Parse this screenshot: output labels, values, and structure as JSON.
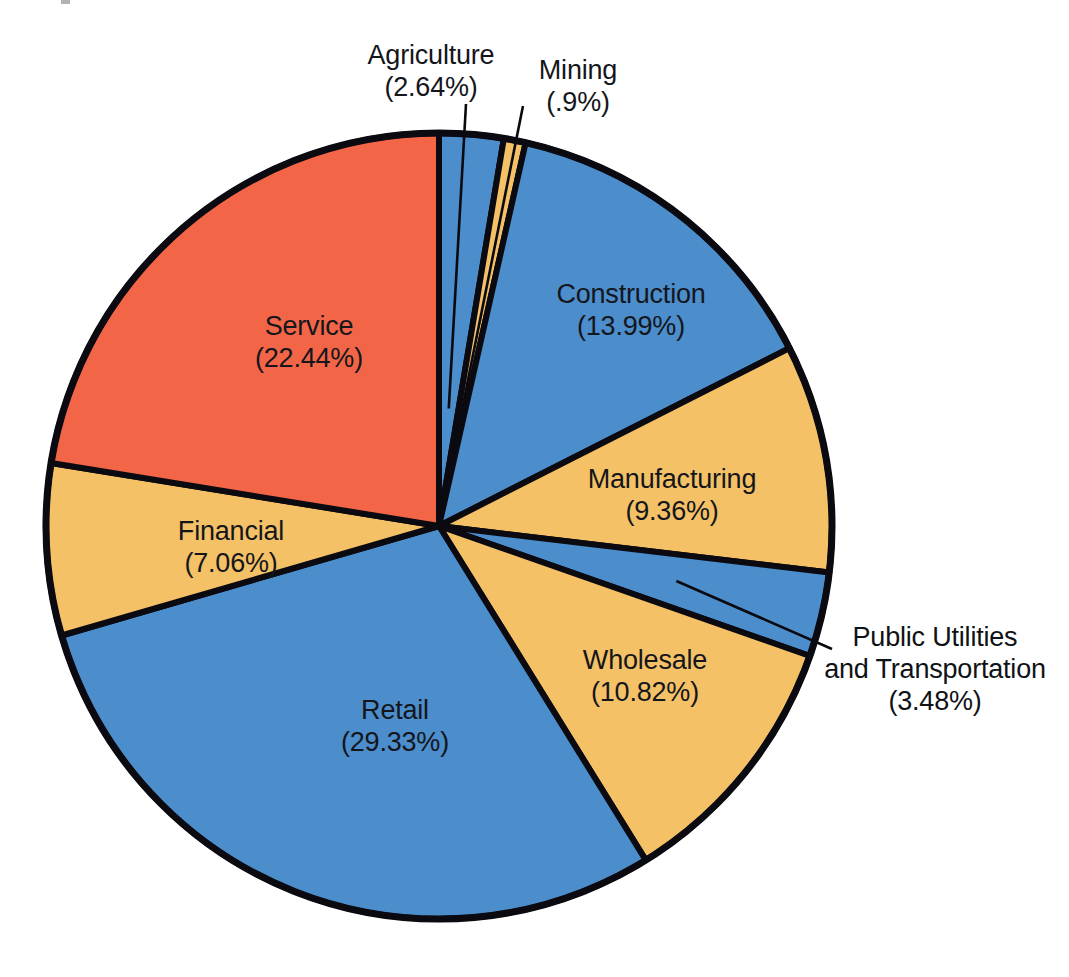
{
  "chart_data": {
    "type": "pie",
    "title": "",
    "subtitle": "",
    "xlabel": "",
    "ylabel": "",
    "legend_position": "none",
    "grid": false,
    "units": "percent",
    "total": 100,
    "start_angle_deg": 0,
    "direction": "clockwise",
    "categories": [
      "Agriculture",
      "Mining",
      "Construction",
      "Manufacturing",
      "Public Utilities and Transportation",
      "Wholesale",
      "Retail",
      "Financial",
      "Service"
    ],
    "values": [
      2.64,
      0.9,
      13.99,
      9.36,
      3.48,
      10.82,
      29.33,
      7.06,
      22.44
    ],
    "slices": [
      {
        "name": "Agriculture",
        "value": 2.64,
        "percent_text": "(2.64%)",
        "color": "#4C8DCB",
        "label_placement": "outside",
        "leader_line": true
      },
      {
        "name": "Mining",
        "value": 0.9,
        "percent_text": "(.9%)",
        "color": "#F5C167",
        "label_placement": "outside",
        "leader_line": true
      },
      {
        "name": "Construction",
        "value": 13.99,
        "percent_text": "(13.99%)",
        "color": "#4C8DCB",
        "label_placement": "inside",
        "leader_line": false
      },
      {
        "name": "Manufacturing",
        "value": 9.36,
        "percent_text": "(9.36%)",
        "color": "#F5C167",
        "label_placement": "inside",
        "leader_line": false
      },
      {
        "name": "Public Utilities and Transportation",
        "value": 3.48,
        "percent_text": "(3.48%)",
        "color": "#4C8DCB",
        "label_placement": "outside",
        "leader_line": true
      },
      {
        "name": "Wholesale",
        "value": 10.82,
        "percent_text": "(10.82%)",
        "color": "#F5C167",
        "label_placement": "inside",
        "leader_line": false
      },
      {
        "name": "Retail",
        "value": 29.33,
        "percent_text": "(29.33%)",
        "color": "#4C8DCB",
        "label_placement": "inside",
        "leader_line": false
      },
      {
        "name": "Financial",
        "value": 7.06,
        "percent_text": "(7.06%)",
        "color": "#F5C167",
        "label_placement": "inside",
        "leader_line": false
      },
      {
        "name": "Service",
        "value": 22.44,
        "percent_text": "(22.44%)",
        "color": "#F26547",
        "label_placement": "inside",
        "leader_line": false
      }
    ],
    "colors": {
      "blue": "#4C8DCB",
      "gold": "#F5C167",
      "red": "#F26547",
      "outline": "#0A0A10",
      "background": "#FFFFFF"
    }
  },
  "labels": {
    "agriculture": {
      "name": "Agriculture",
      "pct": "(2.64%)"
    },
    "mining": {
      "name": "Mining",
      "pct": "(.9%)"
    },
    "construction": {
      "name": "Construction",
      "pct": "(13.99%)"
    },
    "manufacturing": {
      "name": "Manufacturing",
      "pct": "(9.36%)"
    },
    "public_utilities": {
      "name_line1": "Public Utilities",
      "name_line2": "and Transportation",
      "pct": "(3.48%)"
    },
    "wholesale": {
      "name": "Wholesale",
      "pct": "(10.82%)"
    },
    "retail": {
      "name": "Retail",
      "pct": "(29.33%)"
    },
    "financial": {
      "name": "Financial",
      "pct": "(7.06%)"
    },
    "service": {
      "name": "Service",
      "pct": "(22.44%)"
    }
  }
}
